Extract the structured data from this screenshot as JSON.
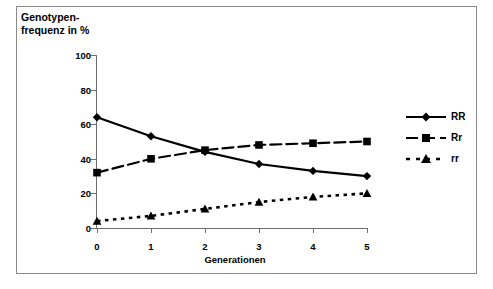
{
  "chart_data": {
    "type": "line",
    "title": "Genotypen-\nfrequenz in %",
    "ylabel": "Genotypenfrequenz in %",
    "xlabel": "Generationen",
    "categories": [
      "0",
      "1",
      "2",
      "3",
      "4",
      "5"
    ],
    "x": [
      0,
      1,
      2,
      3,
      4,
      5
    ],
    "xlim": [
      0,
      5
    ],
    "ylim": [
      0,
      100
    ],
    "yticks": [
      0,
      20,
      40,
      60,
      80,
      100
    ],
    "xticks": [
      0,
      1,
      2,
      3,
      4,
      5
    ],
    "grid": false,
    "legend_position": "right",
    "series": [
      {
        "name": "RR",
        "values": [
          64,
          53,
          44,
          37,
          33,
          30
        ],
        "marker": "diamond",
        "linestyle": "solid",
        "color": "#000000"
      },
      {
        "name": "Rr",
        "values": [
          32,
          40,
          45,
          48,
          49,
          50
        ],
        "marker": "square",
        "linestyle": "dashed",
        "color": "#000000"
      },
      {
        "name": "rr",
        "values": [
          4,
          7,
          11,
          15,
          18,
          20
        ],
        "marker": "triangle",
        "linestyle": "dotted",
        "color": "#000000"
      }
    ]
  },
  "axes": {
    "y_tick_labels": [
      "100",
      "80",
      "60",
      "40",
      "20",
      "0"
    ],
    "x_tick_labels": [
      "0",
      "1",
      "2",
      "3",
      "4",
      "5"
    ],
    "x_axis_title": "Generationen",
    "y_axis_title": "Genotypen-\nfrequenz in %"
  },
  "legend": {
    "items": [
      {
        "label": "RR"
      },
      {
        "label": "Rr"
      },
      {
        "label": "rr"
      }
    ]
  },
  "colors": {
    "line": "#000000",
    "axis": "#6e6e6e",
    "frame": "#8a8a8a",
    "background": "#ffffff"
  }
}
